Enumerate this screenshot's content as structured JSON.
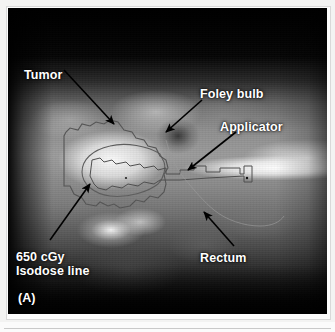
{
  "figure": {
    "panel_letter": "(A)",
    "modality": "transrectal-ultrasound-dose-plan",
    "background_color": "#000000",
    "label_color": "#ffffff",
    "arrow_color": "#000000",
    "contour_color": "#4a4a4a"
  },
  "annotations": [
    {
      "id": "tumor",
      "label": "Tumor",
      "arrow_from": [
        72,
        78
      ],
      "arrow_to": [
        112,
        122
      ],
      "arrow_direction": "down-right"
    },
    {
      "id": "foley-bulb",
      "label": "Foley bulb",
      "arrow_from": [
        196,
        96
      ],
      "arrow_to": [
        158,
        128
      ],
      "arrow_direction": "down-left"
    },
    {
      "id": "applicator",
      "label": "Applicator",
      "arrow_from": [
        228,
        130
      ],
      "arrow_to": [
        182,
        164
      ],
      "arrow_direction": "down-left"
    },
    {
      "id": "isodose-line",
      "label_line1": "650 cGy",
      "label_line2": "Isodose line",
      "dose_value": "650",
      "dose_unit": "cGy",
      "arrow_from": [
        58,
        236
      ],
      "arrow_to": [
        84,
        180
      ],
      "arrow_direction": "up-right"
    },
    {
      "id": "rectum",
      "label": "Rectum",
      "arrow_from": [
        228,
        240
      ],
      "arrow_to": [
        198,
        208
      ],
      "arrow_direction": "up-left"
    }
  ],
  "structures": {
    "tumor_contour": "irregular polygon enclosing hyperechoic mass, left-of-center",
    "isodose_contour": "smooth rounded closed curve inside tumor contour",
    "applicator_contour": "stepped tubular outline extending to the right edge",
    "rectum_contour": "faint contour lower-right"
  }
}
